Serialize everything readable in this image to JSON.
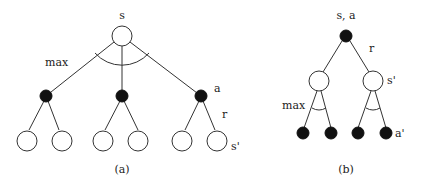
{
  "diagram_a": {
    "caption": "(a)",
    "root_label": "s",
    "max_label": "max",
    "action_label": "a",
    "reward_label": "r",
    "next_state_label": "s'"
  },
  "diagram_b": {
    "caption": "(b)",
    "root_label": "s, a",
    "reward_label": "r",
    "next_state_label": "s'",
    "max_label": "max",
    "next_action_label": "a'"
  },
  "colors": {
    "state_node_fill": "#ffffff",
    "action_node_fill": "#111111",
    "edge": "#333333"
  }
}
